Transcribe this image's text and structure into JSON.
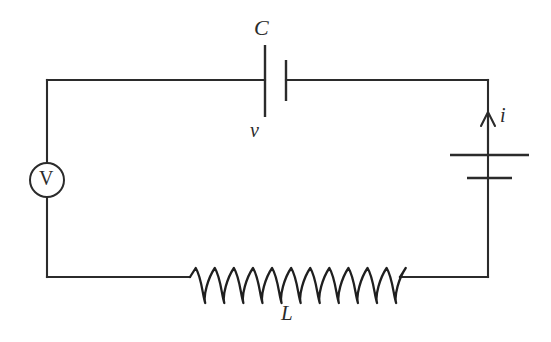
{
  "figure": {
    "kind": "circuit-diagram",
    "title": "",
    "background_color": "#ffffff",
    "line_color": "#2b2b2b",
    "width": 551,
    "height": 342
  },
  "labels": {
    "capacitor": "C",
    "capacitor_voltage": "v",
    "current": "i",
    "inductor": "L",
    "voltmeter": "V"
  },
  "components": [
    {
      "name": "voltmeter",
      "symbol": "V",
      "kind": "meter-circle",
      "position": "left-branch",
      "cx": 47,
      "cy": 180,
      "r": 17
    },
    {
      "name": "capacitor",
      "symbol": "C",
      "secondary_symbol": "v",
      "kind": "capacitor-plates",
      "position": "top-branch",
      "left_plate_x": 265,
      "right_plate_x": 286,
      "left_plate_y1": 45,
      "left_plate_y2": 117,
      "right_plate_y1": 60,
      "right_plate_y2": 101
    },
    {
      "name": "battery",
      "symbol": "",
      "kind": "battery-cell",
      "position": "right-branch",
      "long_plate_y": 155,
      "long_plate_x1": 450,
      "long_plate_x2": 529,
      "short_plate_y": 178,
      "short_plate_x1": 467,
      "short_plate_x2": 512
    },
    {
      "name": "inductor",
      "symbol": "L",
      "kind": "coil",
      "position": "bottom-branch",
      "x_start": 190,
      "x_end": 400,
      "loops": 11,
      "baseline_y": 277
    },
    {
      "name": "current-arrow",
      "symbol": "i",
      "kind": "arrow",
      "direction": "up",
      "x": 488,
      "y_tail": 152,
      "y_tip": 112
    }
  ],
  "loop": {
    "left_x": 47,
    "right_x": 488,
    "top_y": 80,
    "bottom_y": 277
  }
}
